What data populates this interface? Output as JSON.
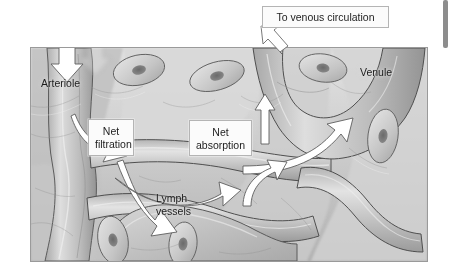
{
  "figure": {
    "title_alt": "Capillary exchange: net filtration and net absorption",
    "frame": {
      "x": 30,
      "y": 47,
      "width": 398,
      "height": 215
    }
  },
  "callouts": [
    {
      "id": "venous",
      "label": "To venous circulation"
    },
    {
      "id": "filtration",
      "label": "Net\nfiltration"
    },
    {
      "id": "absorption",
      "label": "Net\nabsorption"
    }
  ],
  "tissue_labels": [
    {
      "id": "arteriole",
      "label": "Arteriole"
    },
    {
      "id": "venule",
      "label": "Venule"
    },
    {
      "id": "lymph",
      "label": "Lymph\nvessels"
    }
  ],
  "arrows": [
    {
      "id": "inflow-arteriole",
      "direction": "down",
      "description": "blood entering arteriole"
    },
    {
      "id": "arteriole-to-filtration",
      "direction": "down-right",
      "description": "curved arrow from arteriole to net filtration"
    },
    {
      "id": "filtration-to-lymph",
      "direction": "down-right",
      "description": "curved arrow from net filtration to lymph vessels"
    },
    {
      "id": "interstitium-to-absorption",
      "direction": "up-right",
      "description": "curved arrow rising into net absorption"
    },
    {
      "id": "absorption-to-venule",
      "direction": "up-right",
      "description": "curved arrow from net absorption into venule"
    },
    {
      "id": "lymph-return",
      "direction": "up",
      "description": "curved arrow returning upward near venule"
    },
    {
      "id": "venule-up",
      "direction": "up",
      "description": "straight arrow up inside venule"
    },
    {
      "id": "to-venous-circulation",
      "direction": "up-left",
      "description": "arrow pointing to To venous circulation box"
    }
  ],
  "colors": {
    "tissue_light": "#dcdcdc",
    "tissue_mid": "#bdbdbd",
    "tissue_dark": "#9a9a9a",
    "vessel_outline": "#4a4a4a",
    "nucleus": "#6f6f6f",
    "arrow_fill": "#ffffff",
    "arrow_outline": "#5a5a5a",
    "callout_bg": "#fbfbfb",
    "callout_border": "#b4b4b4",
    "text": "#1c1c1c",
    "scrollbar": "#8d8d8d",
    "page_bg": "#ffffff"
  },
  "scrollbar": {
    "thumb_top": 0,
    "thumb_height": 48
  }
}
